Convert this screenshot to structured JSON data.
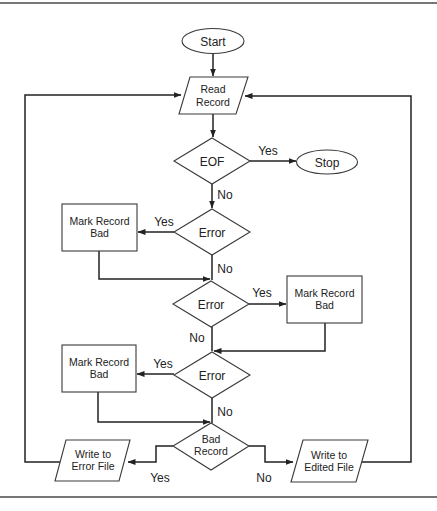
{
  "diagram": {
    "type": "flowchart",
    "nodes": {
      "start": {
        "label": "Start",
        "shape": "terminator"
      },
      "read": {
        "line1": "Read",
        "line2": "Record",
        "shape": "io"
      },
      "eof": {
        "label": "EOF",
        "shape": "decision"
      },
      "stop": {
        "label": "Stop",
        "shape": "terminator"
      },
      "error1": {
        "label": "Error",
        "shape": "decision"
      },
      "mark1": {
        "line1": "Mark Record",
        "line2": "Bad",
        "shape": "process"
      },
      "error2": {
        "label": "Error",
        "shape": "decision"
      },
      "mark2": {
        "line1": "Mark Record",
        "line2": "Bad",
        "shape": "process"
      },
      "error3": {
        "label": "Error",
        "shape": "decision"
      },
      "mark3": {
        "line1": "Mark Record",
        "line2": "Bad",
        "shape": "process"
      },
      "bad": {
        "line1": "Bad",
        "line2": "Record",
        "shape": "decision"
      },
      "write_error": {
        "line1": "Write to",
        "line2": "Error File",
        "shape": "io"
      },
      "write_edited": {
        "line1": "Write to",
        "line2": "Edited File",
        "shape": "io"
      }
    },
    "edge_labels": {
      "eof_yes": "Yes",
      "eof_no": "No",
      "error1_yes": "Yes",
      "error1_no": "No",
      "error2_yes": "Yes",
      "error2_no": "No",
      "error3_yes": "Yes",
      "error3_no": "No",
      "bad_yes": "Yes",
      "bad_no": "No"
    },
    "edges": [
      [
        "Start",
        "Read Record"
      ],
      [
        "Read Record",
        "EOF"
      ],
      [
        "EOF",
        "Stop",
        "Yes"
      ],
      [
        "EOF",
        "Error 1",
        "No"
      ],
      [
        "Error 1",
        "Mark Record Bad 1",
        "Yes"
      ],
      [
        "Error 1",
        "Error 2",
        "No"
      ],
      [
        "Mark Record Bad 1",
        "Error 2"
      ],
      [
        "Error 2",
        "Mark Record Bad 2",
        "Yes"
      ],
      [
        "Error 2",
        "Error 3",
        "No"
      ],
      [
        "Mark Record Bad 2",
        "Error 3"
      ],
      [
        "Error 3",
        "Mark Record Bad 3",
        "Yes"
      ],
      [
        "Error 3",
        "Bad Record",
        "No"
      ],
      [
        "Mark Record Bad 3",
        "Bad Record"
      ],
      [
        "Bad Record",
        "Write to Error File",
        "Yes"
      ],
      [
        "Bad Record",
        "Write to Edited File",
        "No"
      ],
      [
        "Write to Error File",
        "Read Record"
      ],
      [
        "Write to Edited File",
        "Read Record"
      ]
    ]
  }
}
